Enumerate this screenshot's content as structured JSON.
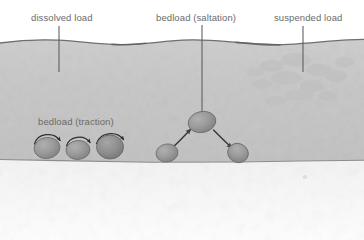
{
  "diagram": {
    "type": "cross-section illustration",
    "labels": {
      "dissolved": "dissolved load",
      "saltation": "bedload (saltation)",
      "suspended": "suspended load",
      "traction": "bedload (traction)"
    },
    "colors": {
      "water": "#c6c6c6",
      "water_top": "#cfcfcf",
      "water_surface_line": "#6e6e6e",
      "bed_line": "#8a8a8a",
      "bed_fill": "#f4f4f4",
      "pebble": "#9a9a9a",
      "pebble_dark": "#7e7e7e",
      "pebble_outline": "#6d6d6d",
      "arrow": "#3c3c3c",
      "leader": "#5a5a5a",
      "text": "#6a6a6a",
      "background": "#ffffff"
    },
    "leaders": [
      {
        "name": "dissolved-leader",
        "x": 59,
        "y1": 26,
        "y2": 72
      },
      {
        "name": "saltation-leader",
        "x": 202,
        "y1": 25,
        "y2": 116
      },
      {
        "name": "suspended-leader",
        "x": 303,
        "y1": 26,
        "y2": 72
      }
    ],
    "traction_pebbles": [
      {
        "cx": 47,
        "cy": 148,
        "rx": 13,
        "ry": 10.5,
        "rot": -8
      },
      {
        "cx": 78,
        "cy": 150,
        "rx": 12,
        "ry": 9.5,
        "rot": -5
      },
      {
        "cx": 110,
        "cy": 147,
        "rx": 13.5,
        "ry": 12,
        "rot": 0
      }
    ],
    "traction_spin_arrows": [
      {
        "name": "spin-arrow-1",
        "cx": 47,
        "cy": 145,
        "r": 14
      },
      {
        "name": "spin-arrow-2",
        "cx": 78,
        "cy": 146,
        "r": 13
      },
      {
        "name": "spin-arrow-3",
        "cx": 110,
        "cy": 143,
        "r": 15
      }
    ],
    "saltation_pebbles": [
      {
        "name": "saltation-pebble-start",
        "cx": 167,
        "cy": 153,
        "rx": 11,
        "ry": 9,
        "rot": -10
      },
      {
        "name": "saltation-pebble-apex",
        "cx": 202,
        "cy": 122,
        "rx": 14,
        "ry": 10.5,
        "rot": -12
      },
      {
        "name": "saltation-pebble-end",
        "cx": 238,
        "cy": 153,
        "rx": 10.5,
        "ry": 9.5,
        "rot": 25
      }
    ],
    "saltation_arrows": [
      {
        "name": "saltation-arrow-up",
        "from": [
          175,
          146
        ],
        "to": [
          191,
          129
        ],
        "dir": "up-right"
      },
      {
        "name": "saltation-arrow-down",
        "from": [
          214,
          130
        ],
        "to": [
          231,
          147
        ],
        "dir": "down-right"
      }
    ],
    "water_surface_y": 40,
    "bed_y": 161,
    "suspended_texture": true
  }
}
